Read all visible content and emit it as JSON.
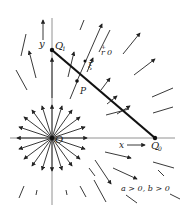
{
  "diagram": {
    "type": "radial vector field",
    "colors": {
      "stroke": "#222222",
      "axis": "#666666",
      "background": "#ffffff"
    },
    "origin": {
      "label": "O",
      "x": 52,
      "y": 138
    },
    "points": [
      {
        "id": "Q1",
        "label": "Q",
        "sub": "1",
        "x": 52,
        "y": 50
      },
      {
        "id": "Q0",
        "label": "Q",
        "sub": "0",
        "x": 155,
        "y": 138
      },
      {
        "id": "P",
        "label": "P",
        "x": 77,
        "y": 81
      }
    ],
    "axes": {
      "x_label": "x",
      "y_label": "y"
    },
    "annotations": {
      "r_label": "r",
      "r_sup": "+",
      "r_suffix": "0",
      "xi_label": "ξ",
      "condition": "a > 0, b > 0"
    }
  }
}
